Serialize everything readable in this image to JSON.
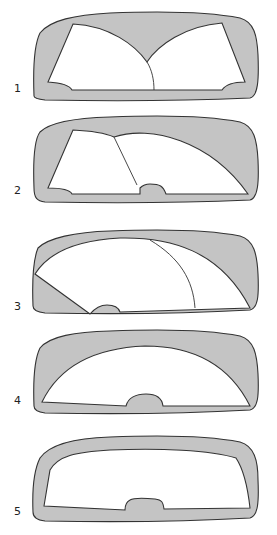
{
  "figure": {
    "colors": {
      "frame_fill": "#c4c4c4",
      "cleared_area": "#ffffff",
      "outline": "#333333"
    },
    "panels": [
      {
        "label": "1",
        "caption": "Two overlapping wiper arcs, symmetric tandem pattern"
      },
      {
        "label": "2",
        "caption": "Two wiper arcs, asymmetric overlapping pattern"
      },
      {
        "label": "3",
        "caption": "Single large arc with inner arc, left triangle uncleared"
      },
      {
        "label": "4",
        "caption": "Single semicircular sweep with central hub"
      },
      {
        "label": "5",
        "caption": "Near-full clearing with small central hub"
      }
    ]
  }
}
